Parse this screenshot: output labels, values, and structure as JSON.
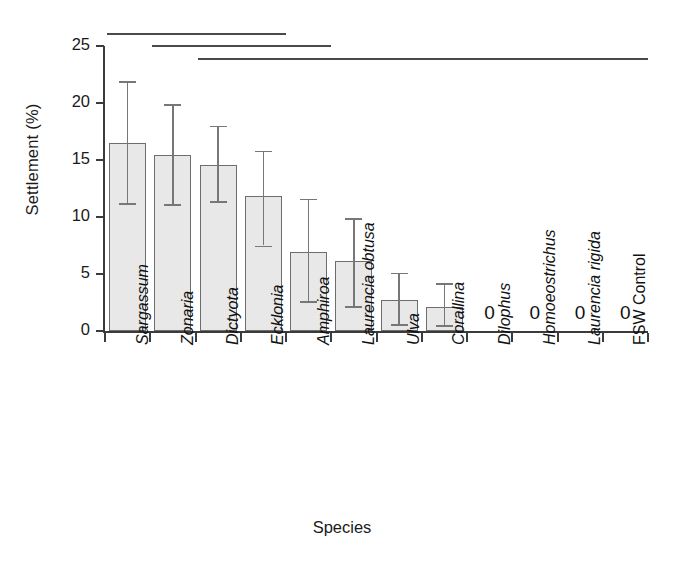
{
  "chart_data": {
    "type": "bar",
    "title": "",
    "xlabel": "Species",
    "ylabel": "Settlement (%)",
    "ylim": [
      0,
      25
    ],
    "yticks": [
      0,
      5,
      10,
      15,
      20,
      25
    ],
    "ytick_labels": [
      "0",
      "5",
      "10",
      "15",
      "20",
      "25"
    ],
    "grid": false,
    "legend": "none",
    "categories": [
      "Sargassum",
      "Zonaria",
      "Dictyota",
      "Ecklonia",
      "Amphiroa",
      "Laurencia obtusa",
      "Ulva",
      "Corallina",
      "Dilophus",
      "Homoeostrichus",
      "Laurencia rigida",
      "FSW Control"
    ],
    "category_styles": [
      "italic",
      "italic",
      "italic",
      "italic",
      "italic",
      "italic",
      "italic",
      "italic",
      "italic",
      "italic",
      "italic",
      "upright"
    ],
    "values": [
      16.5,
      15.4,
      14.6,
      11.8,
      6.9,
      6.1,
      2.7,
      2.1,
      0,
      0,
      0,
      0
    ],
    "error_upper": [
      21.9,
      19.9,
      18.0,
      15.8,
      11.6,
      9.9,
      5.1,
      4.2,
      0,
      0,
      0,
      0
    ],
    "error_lower": [
      11.2,
      11.1,
      11.4,
      7.5,
      2.6,
      2.2,
      0.6,
      0.5,
      0,
      0,
      0,
      0
    ],
    "zero_labels": [
      "0",
      "0",
      "0",
      "0"
    ],
    "zero_label_categories": [
      "Dilophus",
      "Homoeostrichus",
      "Laurencia rigida",
      "FSW Control"
    ],
    "significance_lines": [
      {
        "from_category": "Sargassum",
        "to_category": "Ecklonia"
      },
      {
        "from_category": "Zonaria",
        "to_category": "Amphiroa"
      },
      {
        "from_category": "Dictyota",
        "to_category": "FSW Control"
      }
    ],
    "bar_fill_color": "#e8e8e8",
    "bar_edge_color": "#6d6d6d",
    "error_bar_color": "#777777",
    "axis_color": "#3b3b3b"
  }
}
